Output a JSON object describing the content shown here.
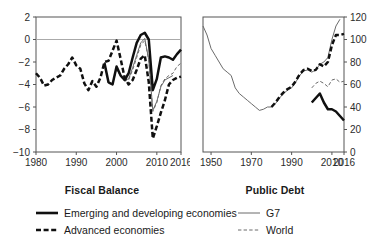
{
  "figure": {
    "background": "#ffffff",
    "colors": {
      "thick_line": "#101010",
      "thin_line": "#6b6b6b",
      "axis": "#555555",
      "zero_gridline": "#aaaaaa",
      "text": "#1a1a1a"
    }
  },
  "legend": {
    "position": "bottom",
    "columns": [
      {
        "items": [
          {
            "label": "Emerging and developing economies",
            "style": "solid-thick",
            "swatch": "legend-line-solid-thick"
          },
          {
            "label": "Advanced economies",
            "style": "dashed-thick",
            "swatch": "legend-line-dashed-thick"
          }
        ]
      },
      {
        "items": [
          {
            "label": "G7",
            "style": "solid-thin",
            "swatch": "legend-line-solid-thin"
          },
          {
            "label": "World",
            "style": "dashed-thin",
            "swatch": "legend-line-dashed-thin"
          }
        ]
      }
    ]
  },
  "chart_data": [
    {
      "id": "fiscal-balance",
      "type": "line",
      "title": "Fiscal Balance",
      "xlabel": "",
      "ylabel": "",
      "xlim": [
        1980,
        2016
      ],
      "ylim": [
        -10,
        2
      ],
      "yticks": [
        2,
        0,
        -2,
        -4,
        -6,
        -8,
        -10
      ],
      "ytick_labels": [
        "2",
        "0",
        "−2",
        "−4",
        "−6",
        "−8",
        "−10"
      ],
      "xticks": [
        1980,
        1990,
        2000,
        2010,
        2016
      ],
      "xtick_labels": [
        "1980",
        "1990",
        "2000",
        "2010",
        "2016"
      ],
      "grid": false,
      "zero_line": 0,
      "yaxis_side": "left",
      "series": [
        {
          "name": "Advanced economies",
          "style": "dashed-thick",
          "x": [
            1980,
            1981,
            1982,
            1983,
            1984,
            1985,
            1986,
            1987,
            1988,
            1989,
            1990,
            1991,
            1992,
            1993,
            1994,
            1995,
            1996,
            1997,
            1998,
            1999,
            2000,
            2001,
            2002,
            2003,
            2004,
            2005,
            2006,
            2007,
            2008,
            2009,
            2010,
            2011,
            2012,
            2013,
            2014,
            2015,
            2016
          ],
          "values": [
            -3.0,
            -3.4,
            -4.1,
            -4.0,
            -3.6,
            -3.4,
            -3.2,
            -2.6,
            -2.2,
            -1.6,
            -2.3,
            -2.6,
            -3.9,
            -4.5,
            -3.7,
            -4.2,
            -3.4,
            -2.0,
            -1.9,
            -1.0,
            -0.1,
            -1.7,
            -3.4,
            -4.0,
            -3.6,
            -2.7,
            -1.7,
            -1.4,
            -3.8,
            -8.8,
            -7.7,
            -6.5,
            -5.4,
            -4.0,
            -3.6,
            -3.4,
            -3.3
          ]
        },
        {
          "name": "Emerging and developing economies",
          "style": "solid-thick",
          "x": [
            1997,
            1998,
            1999,
            2000,
            2001,
            2002,
            2003,
            2004,
            2005,
            2006,
            2007,
            2008,
            2009,
            2010,
            2011,
            2012,
            2013,
            2014,
            2015,
            2016
          ],
          "values": [
            -2.1,
            -3.8,
            -4.0,
            -2.4,
            -3.2,
            -3.6,
            -3.0,
            -1.6,
            -0.3,
            0.4,
            0.6,
            0.0,
            -4.5,
            -3.5,
            -1.6,
            -1.5,
            -1.6,
            -1.8,
            -1.3,
            -0.9
          ]
        },
        {
          "name": "World",
          "style": "dashed-thin",
          "x": [
            1997,
            1998,
            1999,
            2000,
            2001,
            2002,
            2003,
            2004,
            2005,
            2006,
            2007,
            2008,
            2009,
            2010,
            2011,
            2012,
            2013,
            2014,
            2015,
            2016
          ],
          "values": [
            -2.0,
            -3.9,
            -4.0,
            -2.6,
            -3.3,
            -3.7,
            -3.6,
            -2.7,
            -1.6,
            -0.5,
            -0.1,
            -1.8,
            -6.4,
            -5.6,
            -4.1,
            -3.5,
            -3.2,
            -3.0,
            -2.4,
            -2.1
          ]
        },
        {
          "name": "G7",
          "style": "solid-thin",
          "x": [
            1997,
            1998,
            1999,
            2000,
            2001,
            2002,
            2003,
            2004,
            2005,
            2006,
            2007,
            2008,
            2009,
            2010,
            2011,
            2012,
            2013,
            2014
          ],
          "values": [
            -2.0,
            -3.9,
            -4.0,
            -2.5,
            -3.2,
            -3.6,
            -3.5,
            -2.5,
            -1.4,
            -0.3,
            0.1,
            -1.8,
            -6.3,
            -5.5,
            -4.2,
            -3.6,
            -3.4,
            -3.2
          ]
        }
      ]
    },
    {
      "id": "public-debt",
      "type": "line",
      "title": "Public Debt",
      "xlabel": "",
      "ylabel": "",
      "xlim": [
        1946,
        2016
      ],
      "ylim": [
        0,
        120
      ],
      "yticks": [
        0,
        20,
        40,
        60,
        80,
        100,
        120
      ],
      "ytick_labels": [
        "0",
        "20",
        "40",
        "60",
        "80",
        "100",
        "120"
      ],
      "xticks": [
        1950,
        1970,
        1990,
        2010,
        2016
      ],
      "xtick_labels": [
        "1950",
        "1970",
        "1990",
        "2010",
        "2016"
      ],
      "grid": false,
      "yaxis_side": "right",
      "series": [
        {
          "name": "G7",
          "style": "solid-thin",
          "x": [
            1946,
            1948,
            1950,
            1952,
            1954,
            1956,
            1958,
            1960,
            1962,
            1964,
            1966,
            1968,
            1970,
            1972,
            1974,
            1976,
            1978,
            1980,
            1982,
            1984,
            1986,
            1988,
            1990,
            1992,
            1994,
            1996,
            1998,
            2000,
            2002,
            2004,
            2006,
            2008,
            2010,
            2012,
            2014
          ],
          "values": [
            112,
            104,
            92,
            86,
            80,
            74,
            71,
            68,
            57,
            52,
            49,
            46,
            43,
            40,
            37,
            38,
            40,
            40,
            43,
            48,
            52,
            55,
            57,
            62,
            68,
            72,
            73,
            71,
            73,
            78,
            80,
            84,
            100,
            112,
            118
          ]
        },
        {
          "name": "Advanced economies",
          "style": "dashed-thick",
          "x": [
            1980,
            1982,
            1984,
            1986,
            1988,
            1990,
            1992,
            1994,
            1996,
            1998,
            2000,
            2002,
            2004,
            2006,
            2008,
            2010,
            2012,
            2014,
            2016
          ],
          "values": [
            40,
            44,
            49,
            53,
            56,
            58,
            63,
            69,
            73,
            74,
            72,
            73,
            78,
            76,
            80,
            95,
            104,
            104,
            105
          ]
        },
        {
          "name": "World",
          "style": "dashed-thin",
          "x": [
            2000,
            2002,
            2004,
            2006,
            2008,
            2010,
            2012,
            2014,
            2016
          ],
          "values": [
            57,
            61,
            63,
            61,
            58,
            64,
            65,
            62,
            63
          ]
        },
        {
          "name": "Emerging and developing economies",
          "style": "solid-thick",
          "x": [
            2000,
            2002,
            2004,
            2006,
            2008,
            2010,
            2012,
            2014,
            2016
          ],
          "values": [
            44,
            48,
            52,
            44,
            38,
            38,
            36,
            32,
            28
          ]
        }
      ]
    }
  ]
}
